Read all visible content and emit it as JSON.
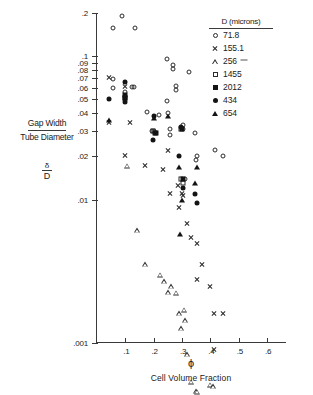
{
  "figure": {
    "y_axis_label_line1": "Gap Width",
    "y_axis_label_line2": "Tube Diameter",
    "y_axis_symbol_num": "δ",
    "y_axis_symbol_den": "D",
    "x_axis_symbol": "ϕ",
    "x_axis_caption": "Cell Volume Fraction"
  },
  "legend": {
    "title": "D (microns)",
    "entries": [
      {
        "label": "71.8",
        "marker": "open-circle"
      },
      {
        "label": "155.1",
        "marker": "x-cross"
      },
      {
        "label": "256",
        "marker": "open-triangle"
      },
      {
        "label": "1455",
        "marker": "open-square"
      },
      {
        "label": "2012",
        "marker": "filled-square"
      },
      {
        "label": "434",
        "marker": "filled-circle"
      },
      {
        "label": "654",
        "marker": "filled-triangle"
      }
    ]
  },
  "chart_data": {
    "type": "scatter",
    "title": "",
    "xlabel": "ϕ  (Cell Volume Fraction)",
    "ylabel": "Gap Width / Tube Diameter  (δ/D)",
    "xscale": "linear",
    "yscale": "log",
    "xlim": [
      0.0,
      0.67
    ],
    "ylim": [
      0.001,
      0.2
    ],
    "xticks": [
      0.1,
      0.2,
      0.3,
      0.4,
      0.5,
      0.6
    ],
    "xticklabels": [
      ".1",
      ".2",
      ".3",
      ".4",
      ".5",
      ".6"
    ],
    "yticks": [
      0.2,
      0.1,
      0.09,
      0.08,
      0.07,
      0.06,
      0.05,
      0.04,
      0.03,
      0.02,
      0.01,
      0.001
    ],
    "yticklabels": [
      ".2",
      ".1",
      ".09",
      ".08",
      ".07",
      ".06",
      ".05",
      ".04",
      ".03",
      ".02",
      ".01",
      ".001"
    ],
    "grid": false,
    "legend_position": "top-right",
    "series": [
      {
        "name": "71.8",
        "marker": "open-circle",
        "points": [
          [
            0.058,
            0.158
          ],
          [
            0.088,
            0.19
          ],
          [
            0.135,
            0.158
          ],
          [
            0.055,
            0.069
          ],
          [
            0.055,
            0.06
          ],
          [
            0.1,
            0.056
          ],
          [
            0.123,
            0.061
          ],
          [
            0.13,
            0.061
          ],
          [
            0.175,
            0.041
          ],
          [
            0.195,
            0.03
          ],
          [
            0.2,
            0.03
          ],
          [
            0.218,
            0.039
          ],
          [
            0.248,
            0.049
          ],
          [
            0.252,
            0.04
          ],
          [
            0.256,
            0.031
          ],
          [
            0.258,
            0.028
          ],
          [
            0.248,
            0.096
          ],
          [
            0.268,
            0.087
          ],
          [
            0.268,
            0.082
          ],
          [
            0.28,
            0.062
          ],
          [
            0.28,
            0.058
          ],
          [
            0.305,
            0.033
          ],
          [
            0.305,
            0.031
          ],
          [
            0.31,
            0.014
          ],
          [
            0.345,
            0.029
          ],
          [
            0.35,
            0.019
          ],
          [
            0.352,
            0.02
          ],
          [
            0.326,
            0.077
          ],
          [
            0.415,
            0.022
          ],
          [
            0.443,
            0.02
          ]
        ]
      },
      {
        "name": "155.1",
        "marker": "x-cross",
        "points": [
          [
            0.042,
            0.071
          ],
          [
            0.042,
            0.038
          ],
          [
            0.1,
            0.074
          ],
          [
            0.118,
            0.046
          ],
          [
            0.1,
            0.03
          ],
          [
            0.168,
            0.028
          ],
          [
            0.233,
            0.029
          ],
          [
            0.252,
            0.043
          ],
          [
            0.258,
            0.024
          ],
          [
            0.285,
            0.03
          ],
          [
            0.288,
            0.023
          ],
          [
            0.3,
            0.032
          ],
          [
            0.305,
            0.034
          ],
          [
            0.318,
            0.024
          ],
          [
            0.33,
            0.021
          ],
          [
            0.352,
            0.021
          ],
          [
            0.352,
            0.013
          ],
          [
            0.372,
            0.018
          ],
          [
            0.398,
            0.014
          ],
          [
            0.412,
            0.01
          ],
          [
            0.445,
            0.011
          ],
          [
            0.412,
            0.0068
          ],
          [
            0.447,
            0.0018
          ]
        ]
      },
      {
        "name": "256",
        "marker": "open-triangle",
        "points": [
          [
            0.105,
            0.158
          ],
          [
            0.14,
            0.061
          ],
          [
            0.168,
            0.038
          ],
          [
            0.222,
            0.035
          ],
          [
            0.238,
            0.034
          ],
          [
            0.252,
            0.031
          ],
          [
            0.262,
            0.037
          ],
          [
            0.278,
            0.036
          ],
          [
            0.288,
            0.028
          ],
          [
            0.295,
            0.024
          ],
          [
            0.308,
            0.035
          ],
          [
            0.31,
            0.032
          ],
          [
            0.318,
            0.02
          ],
          [
            0.33,
            0.014
          ],
          [
            0.348,
            0.013
          ],
          [
            0.352,
            0.014
          ],
          [
            0.398,
            0.017
          ],
          [
            0.408,
            0.018
          ],
          [
            0.43,
            0.014
          ],
          [
            0.443,
            0.014
          ]
        ]
      },
      {
        "name": "1455",
        "marker": "open-square",
        "points": [
          [
            0.1,
            0.051
          ],
          [
            0.198,
            0.03
          ],
          [
            0.295,
            0.031
          ],
          [
            0.297,
            0.014
          ],
          [
            0.302,
            0.013
          ]
        ]
      },
      {
        "name": "2012",
        "marker": "filled-square",
        "points": [
          [
            0.1,
            0.054
          ],
          [
            0.1,
            0.051
          ],
          [
            0.203,
            0.029
          ],
          [
            0.208,
            0.029
          ],
          [
            0.3,
            0.031
          ],
          [
            0.303,
            0.014
          ]
        ]
      },
      {
        "name": "434",
        "marker": "filled-circle",
        "points": [
          [
            0.042,
            0.05
          ],
          [
            0.1,
            0.066
          ],
          [
            0.1,
            0.048
          ],
          [
            0.198,
            0.026
          ],
          [
            0.2,
            0.038
          ],
          [
            0.288,
            0.02
          ],
          [
            0.295,
            0.032
          ],
          [
            0.302,
            0.012
          ],
          [
            0.345,
            0.011
          ],
          [
            0.352,
            0.0095
          ]
        ]
      },
      {
        "name": "654",
        "marker": "filled-triangle",
        "points": [
          [
            0.042,
            0.036
          ],
          [
            0.2,
            0.037
          ],
          [
            0.252,
            0.038
          ],
          [
            0.29,
            0.017
          ],
          [
            0.298,
            0.01
          ],
          [
            0.292,
            0.0058
          ],
          [
            0.352,
            0.017
          ],
          [
            0.345,
            0.013
          ]
        ]
      }
    ]
  }
}
